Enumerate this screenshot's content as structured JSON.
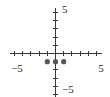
{
  "chart_data": {
    "type": "scatter",
    "title": "",
    "xlabel": "",
    "ylabel": "",
    "xlim": [
      -5,
      5
    ],
    "ylim": [
      -5,
      5
    ],
    "grid": false,
    "legend": null,
    "axis_style": "centered-cross",
    "tick_interval": 1,
    "x_tick_labels_shown": [
      "-5",
      "5"
    ],
    "y_tick_labels_shown": [
      "5",
      "-5"
    ],
    "point_color": "#565656",
    "axis_color": "#3a3a3a",
    "points": [
      {
        "x": -1,
        "y": -1
      },
      {
        "x": 0,
        "y": -1
      },
      {
        "x": 1,
        "y": -1
      }
    ],
    "x": [
      -1,
      0,
      1
    ],
    "y": [
      -1,
      -1,
      -1
    ]
  },
  "labels": {
    "y_top": "5",
    "y_bottom": "−5",
    "x_left": "−5",
    "x_right": "5"
  }
}
